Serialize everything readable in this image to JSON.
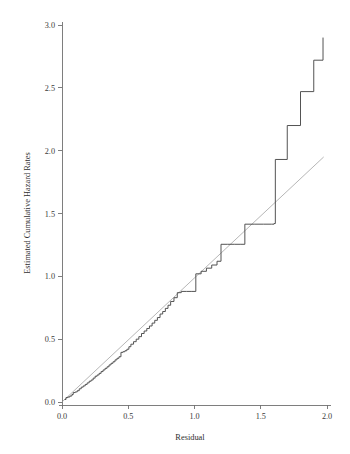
{
  "figure": {
    "background_color": "#ffffff",
    "width": 350,
    "height": 454
  },
  "chart_data": {
    "type": "line",
    "title": "",
    "subtitle": "",
    "xlabel": "Residual",
    "ylabel": "Estimated Cumulative Hazard Rates",
    "xlim": [
      0.0,
      2.0
    ],
    "ylim": [
      0.0,
      3.0
    ],
    "xticks": [
      0.0,
      0.5,
      1.0,
      1.5,
      2.0
    ],
    "xtick_labels": [
      "0.0",
      "0.5",
      "1.0",
      "1.5",
      "2.0"
    ],
    "yticks": [
      0.0,
      0.5,
      1.0,
      1.5,
      2.0,
      2.5,
      3.0
    ],
    "ytick_labels": [
      "0.0",
      "0.5",
      "1.0",
      "1.5",
      "2.0",
      "2.5",
      "3.0"
    ],
    "grid": false,
    "legend": false,
    "legend_position": "none",
    "colors": {
      "step_curve": "#4a4a4a",
      "reference_line": "#a9a9a9",
      "axis": "#707070",
      "text": "#2e2e2e"
    },
    "series": [
      {
        "name": "Estimated cumulative hazard (Nelson-Aalen step function)",
        "drawstyle": "steps-post",
        "color": "#4a4a4a",
        "x": [
          0.02,
          0.03,
          0.045,
          0.06,
          0.075,
          0.085,
          0.1,
          0.115,
          0.13,
          0.145,
          0.16,
          0.175,
          0.19,
          0.205,
          0.22,
          0.235,
          0.25,
          0.265,
          0.28,
          0.295,
          0.31,
          0.325,
          0.34,
          0.355,
          0.37,
          0.385,
          0.4,
          0.415,
          0.43,
          0.445,
          0.46,
          0.475,
          0.49,
          0.505,
          0.52,
          0.54,
          0.56,
          0.58,
          0.6,
          0.62,
          0.64,
          0.66,
          0.68,
          0.7,
          0.72,
          0.74,
          0.76,
          0.78,
          0.8,
          0.82,
          0.845,
          0.87,
          0.9,
          0.94,
          0.98,
          1.01,
          1.05,
          1.09,
          1.13,
          1.17,
          1.2,
          1.25,
          1.3,
          1.35,
          1.38,
          1.45,
          1.52,
          1.58,
          1.6,
          1.61,
          1.7,
          1.8,
          1.9,
          1.97
        ],
        "y": [
          0.02,
          0.035,
          0.04,
          0.048,
          0.06,
          0.075,
          0.08,
          0.09,
          0.105,
          0.118,
          0.128,
          0.14,
          0.152,
          0.165,
          0.175,
          0.19,
          0.205,
          0.215,
          0.228,
          0.242,
          0.255,
          0.268,
          0.28,
          0.295,
          0.308,
          0.32,
          0.335,
          0.348,
          0.36,
          0.395,
          0.4,
          0.408,
          0.42,
          0.44,
          0.46,
          0.48,
          0.5,
          0.52,
          0.545,
          0.565,
          0.585,
          0.605,
          0.628,
          0.65,
          0.672,
          0.7,
          0.72,
          0.745,
          0.77,
          0.8,
          0.83,
          0.87,
          0.88,
          0.88,
          0.88,
          1.02,
          1.04,
          1.065,
          1.09,
          1.12,
          1.255,
          1.255,
          1.255,
          1.255,
          1.415,
          1.415,
          1.415,
          1.415,
          1.42,
          1.93,
          2.2,
          2.47,
          2.72,
          2.9
        ]
      },
      {
        "name": "Reference line (45-degree)",
        "drawstyle": "line",
        "color": "#a9a9a9",
        "x": [
          0.005,
          1.975
        ],
        "y": [
          0.005,
          1.95
        ]
      }
    ],
    "annotations": []
  },
  "axes": {
    "x_axis_name": "x-axis",
    "y_axis_name": "y-axis"
  }
}
